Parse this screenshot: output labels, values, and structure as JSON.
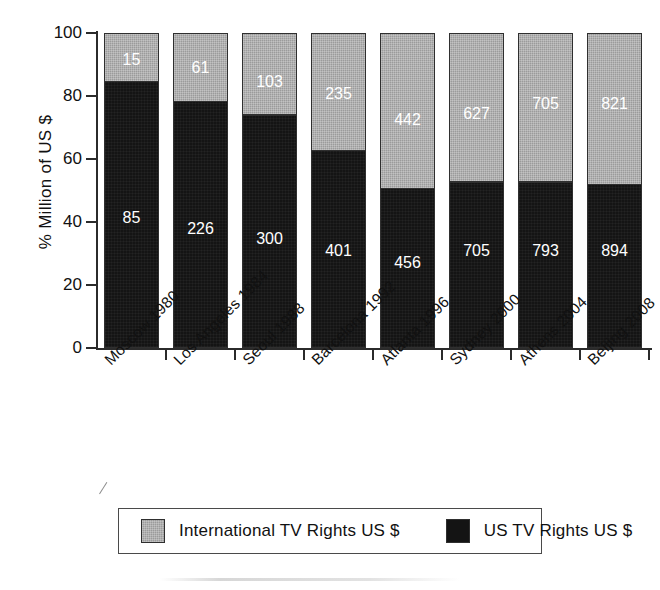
{
  "chart_data": {
    "type": "bar",
    "subtype": "stacked-100-percent",
    "title": "",
    "xlabel": "",
    "ylabel": "% Million of US $",
    "ylim": [
      0,
      100
    ],
    "yticks": [
      0,
      20,
      40,
      60,
      80,
      100
    ],
    "grid": false,
    "legend_position": "bottom",
    "categories": [
      "Moscow 1980",
      "Los Angeles 1984",
      "Seoul 1988",
      "Barcelona 1992",
      "Atlanta 1996",
      "Sydney 2000",
      "Athens 2004",
      "Beijing 2008"
    ],
    "series": [
      {
        "name": "US TV Rights US $",
        "color": "#141414",
        "values": [
          85,
          226,
          300,
          401,
          456,
          705,
          793,
          894
        ],
        "percent": [
          85.0,
          78.7,
          74.4,
          63.0,
          50.8,
          52.9,
          52.9,
          52.1
        ]
      },
      {
        "name": "International TV Rights US $",
        "color": "#9b9b9b",
        "values": [
          15,
          61,
          103,
          235,
          442,
          627,
          705,
          821
        ],
        "percent": [
          15.0,
          21.3,
          25.6,
          37.0,
          49.2,
          47.1,
          47.1,
          47.9
        ]
      }
    ]
  },
  "legend": {
    "entries": [
      {
        "label": "International TV Rights US $",
        "swatch": "gray-swatch"
      },
      {
        "label": "US TV Rights US $",
        "swatch": "black-swatch"
      }
    ]
  }
}
